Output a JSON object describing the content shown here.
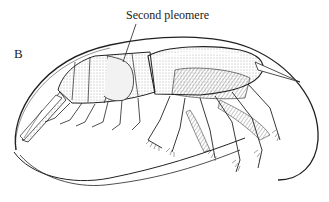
{
  "figure": {
    "panel_letter": "B",
    "callout": {
      "label": "Second pleomere"
    },
    "colors": {
      "ink": "#222222",
      "shade": "#8a8a8a",
      "background": "#ffffff"
    }
  }
}
